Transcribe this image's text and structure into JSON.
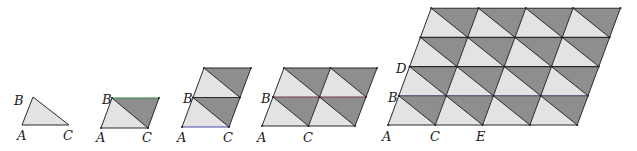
{
  "diagram": {
    "colors": {
      "light_fill": "#e3e3e3",
      "dark_fill": "#8e8e8e",
      "edge": "#2a2a2a",
      "green_edge": "#3a8a3a",
      "blue_edge": "#4a4aa8",
      "purple_edge": "#7a3a5a",
      "navy_edge": "#3a3a6a"
    },
    "figures": [
      {
        "id": "fig1",
        "origin": [
          22,
          125
        ],
        "u": [
          47,
          0
        ],
        "v": [
          11,
          -28
        ],
        "cols": 1,
        "rows": 1,
        "triangle_only": true,
        "labels": [
          {
            "text": "B",
            "at": [
              14,
              105
            ]
          },
          {
            "text": "A",
            "at": [
              17,
              140
            ]
          },
          {
            "text": "C",
            "at": [
              63,
              140
            ]
          }
        ]
      },
      {
        "id": "fig2",
        "origin": [
          101,
          128
        ],
        "u": [
          47,
          0
        ],
        "v": [
          11,
          -30
        ],
        "cols": 1,
        "rows": 1,
        "highlight": [
          {
            "row_line": 1,
            "color": "green_edge"
          }
        ],
        "labels": [
          {
            "text": "B",
            "at": [
              102,
              104
            ]
          },
          {
            "text": "A",
            "at": [
              96,
              142
            ]
          },
          {
            "text": "C",
            "at": [
              142,
              142
            ]
          }
        ]
      },
      {
        "id": "fig3",
        "origin": [
          182,
          127
        ],
        "u": [
          47,
          0
        ],
        "v": [
          11,
          -29.5
        ],
        "cols": 1,
        "rows": 2,
        "highlight": [
          {
            "row_line": 0,
            "color": "blue_edge"
          }
        ],
        "labels": [
          {
            "text": "B",
            "at": [
              183,
              103
            ]
          },
          {
            "text": "A",
            "at": [
              177,
              142
            ]
          },
          {
            "text": "C",
            "at": [
              223,
              142
            ]
          }
        ]
      },
      {
        "id": "fig4",
        "origin": [
          262,
          126
        ],
        "u": [
          46.5,
          0
        ],
        "v": [
          11,
          -29
        ],
        "cols": 2,
        "rows": 2,
        "highlight": [
          {
            "row_line": 1,
            "color": "purple_edge"
          }
        ],
        "labels": [
          {
            "text": "B",
            "at": [
              261,
              103
            ]
          },
          {
            "text": "A",
            "at": [
              257,
              142
            ]
          },
          {
            "text": "C",
            "at": [
              303,
              142
            ]
          }
        ]
      },
      {
        "id": "fig5",
        "origin": [
          388,
          125
        ],
        "u": [
          47.3,
          0
        ],
        "v": [
          10.8,
          -29.2
        ],
        "cols": 4,
        "rows": 4,
        "highlight": [
          {
            "row_line": 1,
            "color": "navy_edge"
          }
        ],
        "labels": [
          {
            "text": "D",
            "at": [
              396,
              73
            ]
          },
          {
            "text": "B",
            "at": [
              388,
              102
            ]
          },
          {
            "text": "A",
            "at": [
              382,
              141
            ]
          },
          {
            "text": "C",
            "at": [
              430,
              141
            ]
          },
          {
            "text": "E",
            "at": [
              476,
              141
            ]
          }
        ]
      }
    ]
  }
}
